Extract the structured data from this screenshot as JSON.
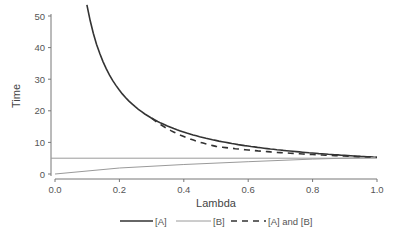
{
  "chart_data": {
    "type": "line",
    "title": "",
    "xlabel": "Lambda",
    "ylabel": "Time",
    "xlim": [
      0.0,
      1.0
    ],
    "ylim": [
      0,
      50
    ],
    "xticks": [
      "0.0",
      "0.2",
      "0.4",
      "0.6",
      "0.8",
      "1.0"
    ],
    "yticks": [
      "0",
      "10",
      "20",
      "30",
      "40",
      "50"
    ],
    "grid": false,
    "legend_position": "bottom",
    "series": [
      {
        "name": "[A]",
        "style": "solid-dark",
        "color": "#333333",
        "x": [
          0.1,
          0.15,
          0.2,
          0.25,
          0.3,
          0.35,
          0.4,
          0.5,
          0.6,
          0.7,
          0.8,
          0.9,
          1.0
        ],
        "values": [
          50.5,
          34.0,
          25.5,
          20.5,
          17.2,
          14.8,
          12.9,
          10.4,
          8.7,
          7.5,
          6.6,
          5.9,
          5.3
        ]
      },
      {
        "name": "[B]",
        "style": "solid-light",
        "color": "#9a9a9a",
        "x": [
          0.0,
          1.0
        ],
        "values": [
          5.0,
          5.0
        ]
      },
      {
        "name": "[B] (rising)",
        "style": "solid-light",
        "color": "#8a8a8a",
        "x": [
          0.0,
          0.2,
          0.4,
          0.6,
          0.8,
          1.0
        ],
        "values": [
          0.0,
          1.9,
          3.0,
          3.9,
          4.7,
          5.3
        ]
      },
      {
        "name": "[A] and [B]",
        "style": "dashed",
        "color": "#333333",
        "x": [
          0.3,
          0.35,
          0.4,
          0.5,
          0.6,
          0.7,
          0.8,
          0.9,
          1.0
        ],
        "values": [
          17.0,
          14.0,
          11.8,
          9.0,
          7.3,
          6.3,
          5.8,
          5.5,
          5.3
        ]
      }
    ],
    "legend": [
      "[A]",
      "[B]",
      "[A] and [B]"
    ]
  },
  "labels": {
    "xlabel": "Lambda",
    "ylabel": "Time",
    "legend_a": "[A]",
    "legend_b": "[B]",
    "legend_ab": "[A] and [B]"
  }
}
